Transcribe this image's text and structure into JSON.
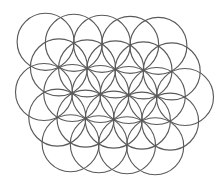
{
  "diagram": {
    "title": "",
    "type": "overlapping-circles-flower-of-life",
    "stroke_color": "#5a5a5a",
    "background": "#ffffff",
    "radius": 28.5,
    "rows": [
      {
        "name": "row-1",
        "centers": [
          [
            45.6,
            41.8
          ],
          [
            73.8,
            42.8
          ],
          [
            102.0,
            43.8
          ],
          [
            130.2,
            44.8
          ],
          [
            158.4,
            45.8
          ]
        ]
      },
      {
        "name": "row-2",
        "centers": [
          [
            58.9,
            67.4
          ],
          [
            87.1,
            68.4
          ],
          [
            115.3,
            69.4
          ],
          [
            143.5,
            70.4
          ],
          [
            171.7,
            71.4
          ]
        ]
      },
      {
        "name": "row-3",
        "centers": [
          [
            44.0,
            92.0
          ],
          [
            72.2,
            93.0
          ],
          [
            100.4,
            94.0
          ],
          [
            128.6,
            95.0
          ],
          [
            156.8,
            96.0
          ],
          [
            185.0,
            97.0
          ]
        ]
      },
      {
        "name": "row-4",
        "centers": [
          [
            57.3,
            117.6
          ],
          [
            85.5,
            118.6
          ],
          [
            113.7,
            119.6
          ],
          [
            141.9,
            120.6
          ],
          [
            170.1,
            121.6
          ]
        ]
      },
      {
        "name": "row-5",
        "centers": [
          [
            70.6,
            143.2
          ],
          [
            98.8,
            144.2
          ],
          [
            127.0,
            145.2
          ],
          [
            155.2,
            146.2
          ]
        ]
      }
    ],
    "circle_count": 25
  }
}
